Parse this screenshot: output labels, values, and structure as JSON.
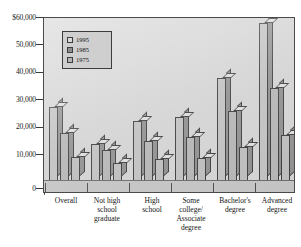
{
  "chart_data": {
    "type": "bar",
    "title": "",
    "xlabel": "",
    "ylabel": "",
    "grid": false,
    "legend_position": "top-left-inside",
    "ylim": [
      0,
      60000
    ],
    "yticks": [
      "0",
      "10,000",
      "20,000",
      "30,000",
      "40,000",
      "50,000",
      "$60,000"
    ],
    "categories": [
      "Overall",
      "Not high\nschool\ngraduate",
      "High\nschool",
      "Some\ncollege/\nAssociate\ndegree",
      "Bachelor's\ndegree",
      "Advanced\ndegree"
    ],
    "series": [
      {
        "name": "1995",
        "values": [
          26000,
          13000,
          21000,
          22500,
          36000,
          55500
        ]
      },
      {
        "name": "1985",
        "values": [
          17000,
          11000,
          14000,
          15500,
          24500,
          32500
        ]
      },
      {
        "name": "1975",
        "values": [
          8500,
          6200,
          7800,
          8200,
          12000,
          16000
        ]
      }
    ],
    "colors": {
      "plot_background": "#d2d2d2",
      "bar_face": "#bcbcbc",
      "bar_side": "#8e8e8e",
      "bar_top": "#dcdcdc",
      "axis": "#3c3c3c",
      "text": "#141414"
    }
  }
}
